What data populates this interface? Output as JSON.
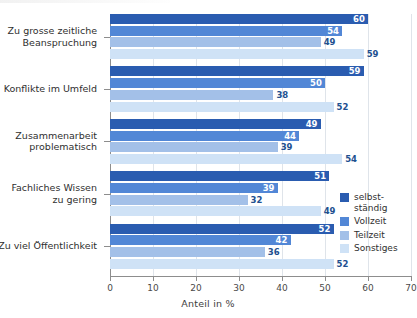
{
  "chart_data": {
    "type": "bar",
    "orientation": "horizontal",
    "title": "",
    "xlabel": "Anteil in %",
    "ylabel": "",
    "xlim": [
      0,
      70
    ],
    "xticks": [
      0,
      10,
      20,
      30,
      40,
      50,
      60,
      70
    ],
    "xtick_labels": [
      "0",
      "10",
      "20",
      "30",
      "40",
      "50",
      "60",
      "70"
    ],
    "grid": true,
    "legend_position": "right",
    "categories": [
      "Zu grosse zeitliche\nBeanspruchung",
      "Konflikte im Umfeld",
      "Zusammenarbeit\nproblematisch",
      "Fachliches Wissen\nzu gering",
      "Zu viel Öffentlichkeit"
    ],
    "series": [
      {
        "name": "selbst-\nständig",
        "legend_label": "selbst-\nständig",
        "color": "#2a5cb0",
        "values": [
          60,
          59,
          49,
          51,
          52
        ]
      },
      {
        "name": "Vollzeit",
        "legend_label": "Vollzeit",
        "color": "#5287d6",
        "values": [
          54,
          50,
          44,
          39,
          42
        ]
      },
      {
        "name": "Teilzeit",
        "legend_label": "Teilzeit",
        "color": "#a3c0e8",
        "values": [
          49,
          38,
          39,
          32,
          36
        ]
      },
      {
        "name": "Sonstiges",
        "legend_label": "Sonstiges",
        "color": "#cfe2f6",
        "values": [
          59,
          52,
          54,
          49,
          52
        ]
      }
    ]
  }
}
